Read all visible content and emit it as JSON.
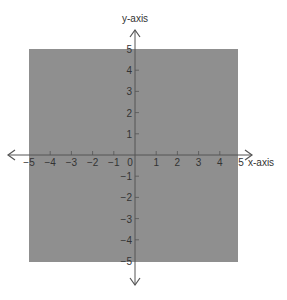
{
  "chart_data": {
    "type": "area",
    "title": "",
    "xlabel": "x-axis",
    "ylabel": "y-axis",
    "xlim": [
      -5,
      5
    ],
    "ylim": [
      -5,
      5
    ],
    "x_ticks": [
      -5,
      -4,
      -3,
      -2,
      -1,
      0,
      1,
      2,
      3,
      4,
      5
    ],
    "y_ticks": [
      -5,
      -4,
      -3,
      -2,
      -1,
      1,
      2,
      3,
      4,
      5
    ],
    "x_tick_labels": [
      "−5",
      "−4",
      "−3",
      "−2",
      "−1",
      "0",
      "1",
      "2",
      "3",
      "4",
      "5"
    ],
    "y_tick_labels": [
      "−5",
      "−4",
      "−3",
      "−2",
      "−1",
      "1",
      "2",
      "3",
      "4",
      "5"
    ],
    "shaded_region": {
      "x_range": [
        -5,
        5
      ],
      "y_range": [
        -5,
        5
      ],
      "color": "#8f8f8f",
      "description": "Square region -5 <= x <= 5, -5 <= y <= 5"
    },
    "grid": false,
    "axes_arrows": true,
    "legend": null
  },
  "labels": {
    "x_axis": "x-axis",
    "y_axis": "y-axis"
  },
  "colors": {
    "shade": "#8f8f8f",
    "axis": "#555555",
    "text": "#333333"
  }
}
